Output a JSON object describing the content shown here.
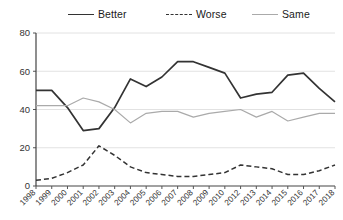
{
  "legend": {
    "items": [
      {
        "label": "Better",
        "style": "solid-dark",
        "color": "#333333"
      },
      {
        "label": "Worse",
        "style": "dashed-dark",
        "color": "#333333"
      },
      {
        "label": "Same",
        "style": "solid-light",
        "color": "#aaaaaa"
      }
    ]
  },
  "chart_data": {
    "type": "line",
    "title": "",
    "xlabel": "",
    "ylabel": "",
    "ylim": [
      0,
      80
    ],
    "yticks": [
      0,
      20,
      40,
      60,
      80
    ],
    "grid": true,
    "legend_position": "top",
    "categories": [
      "1998",
      "1999",
      "2000",
      "2001",
      "2002",
      "2003",
      "2004",
      "2005",
      "2006",
      "2007",
      "2008",
      "2009",
      "2010",
      "2012",
      "2013",
      "2014",
      "2015",
      "2016",
      "2017",
      "2018"
    ],
    "series": [
      {
        "name": "Better",
        "color": "#333333",
        "line_style": "solid",
        "values": [
          50,
          50,
          41,
          29,
          30,
          41,
          56,
          52,
          57,
          65,
          65,
          62,
          59,
          46,
          48,
          49,
          58,
          59,
          51,
          44
        ]
      },
      {
        "name": "Worse",
        "color": "#333333",
        "line_style": "dashed",
        "values": [
          3,
          4,
          7,
          11,
          21,
          16,
          10,
          7,
          6,
          5,
          5,
          6,
          7,
          11,
          10,
          9,
          6,
          6,
          8,
          11
        ]
      },
      {
        "name": "Same",
        "color": "#aaaaaa",
        "line_style": "solid",
        "values": [
          42,
          42,
          42,
          46,
          44,
          40,
          33,
          38,
          39,
          39,
          36,
          38,
          39,
          40,
          36,
          39,
          34,
          36,
          38,
          38
        ]
      }
    ]
  }
}
